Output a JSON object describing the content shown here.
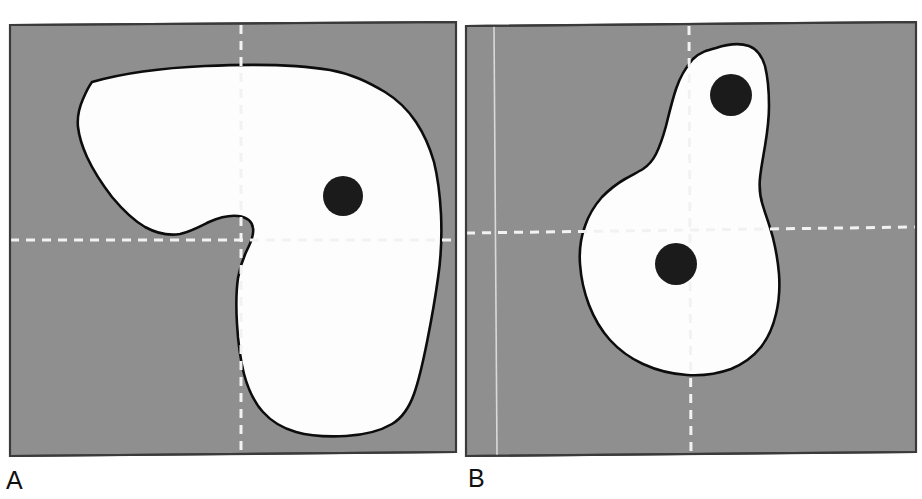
{
  "figure": {
    "type": "two-panel-medical-imaging-figure",
    "width": 922,
    "height": 499,
    "background_color": "#ffffff"
  },
  "colors": {
    "page_background": "#ffffff",
    "panel_background_gray": "#8f8f8f",
    "region_fill_white": "#fdfdfd",
    "region_outline_black": "#0d0d0d",
    "marker_black": "#1b1b1b",
    "crosshair_white": "#f2f2f2",
    "panel_border_dark": "#3a3a3a",
    "label_text": "#111111"
  },
  "panels": [
    {
      "id": "panel-a",
      "label": "A",
      "label_position": {
        "x": 6,
        "y": 468
      },
      "frame": {
        "x": 10,
        "y": 24,
        "width": 446,
        "height": 432
      },
      "background_gray": "#8f8f8f",
      "region": {
        "name": "white-region-a",
        "fill": "#fdfdfd",
        "outline": "#0d0d0d",
        "outline_width": 2.6,
        "shape_note": "Large comma / kidney shaped white area occupying most of the panel; broad lobe across the upper half, narrow waist near center-left, and a rounded bulb filling the lower right quadrant."
      },
      "markers": [
        {
          "name": "marker-a-1",
          "cx": 343,
          "cy": 196,
          "r": 20,
          "fill": "#1b1b1b"
        }
      ],
      "crosshair": {
        "vertical": {
          "x": 241,
          "y1": 24,
          "y2": 456,
          "style": "dashed",
          "color": "#f2f2f2",
          "width": 3
        },
        "horizontal": {
          "y": 240,
          "x1": 10,
          "x2": 456,
          "style": "dashed",
          "color": "#f2f2f2",
          "width": 3
        }
      },
      "guide_lines": []
    },
    {
      "id": "panel-b",
      "label": "B",
      "label_position": {
        "x": 468,
        "y": 466
      },
      "frame": {
        "x": 466,
        "y": 24,
        "width": 450,
        "height": 432
      },
      "background_gray": "#8f8f8f",
      "region": {
        "name": "white-region-b",
        "fill": "#fdfdfd",
        "outline": "#0d0d0d",
        "outline_width": 2.6,
        "shape_note": "Light-bulb / exclamation shaped white area: a narrow vertical neck rising to a rounded cap at the top right of center, widening into a large rounded body in the lower middle of the panel."
      },
      "markers": [
        {
          "name": "marker-b-1",
          "cx": 731,
          "cy": 95,
          "r": 21,
          "fill": "#1b1b1b"
        },
        {
          "name": "marker-b-2",
          "cx": 676,
          "cy": 264,
          "r": 21,
          "fill": "#1b1b1b"
        }
      ],
      "crosshair": {
        "vertical": {
          "x": 689,
          "y1": 24,
          "y2": 456,
          "style": "dashed",
          "color": "#f2f2f2",
          "width": 3
        },
        "horizontal": {
          "y": 230,
          "x1": 466,
          "x2": 916,
          "style": "dashed",
          "color": "#f2f2f2",
          "width": 3
        }
      },
      "guide_lines": [
        {
          "name": "vertical-guide-line",
          "x": 494,
          "y1": 24,
          "y2": 456,
          "style": "solid",
          "color": "#d9d9d9",
          "width": 1.5
        }
      ]
    }
  ],
  "labels": {
    "panel_a": "A",
    "panel_b": "B"
  }
}
